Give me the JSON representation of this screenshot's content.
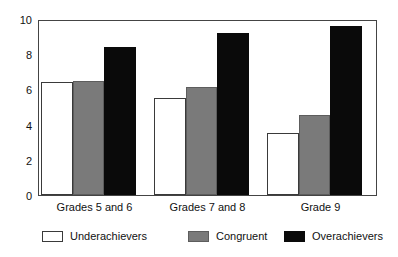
{
  "chart_data": {
    "type": "bar",
    "title": "",
    "subtitle": "",
    "xlabel": "",
    "ylabel": "",
    "categories": [
      "Grades 5 and 6",
      "Grades 7 and 8",
      "Grade 9"
    ],
    "series": [
      {
        "name": "Underachievers",
        "color": "#ffffff",
        "values": [
          6.4,
          5.5,
          3.55
        ]
      },
      {
        "name": "Congruent",
        "color": "#7a7a7a",
        "values": [
          6.5,
          6.15,
          4.55
        ]
      },
      {
        "name": "Overachievers",
        "color": "#0a0a0a",
        "values": [
          8.4,
          9.2,
          9.6
        ]
      }
    ],
    "ylim": [
      0,
      10
    ],
    "yticks": [
      0,
      2,
      4,
      6,
      8,
      10
    ],
    "ytick_labels": [
      "0",
      "2",
      "4",
      "6",
      "8",
      "10"
    ],
    "grid": false,
    "legend_position": "bottom",
    "annotations": []
  },
  "legend": {
    "items": [
      {
        "label": "Underachievers",
        "swatch": "white-swatch"
      },
      {
        "label": "Congruent",
        "swatch": "gray-swatch"
      },
      {
        "label": "Overachievers",
        "swatch": "black-swatch"
      }
    ]
  },
  "colors": {
    "underachievers": "#ffffff",
    "congruent": "#7a7a7a",
    "overachievers": "#0a0a0a",
    "axis": "#444444",
    "text": "#111111"
  }
}
